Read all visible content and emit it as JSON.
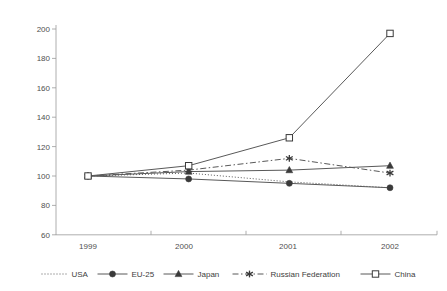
{
  "chart_data": {
    "type": "line",
    "title": "",
    "subtitle": "",
    "xlabel": "",
    "ylabel": "",
    "categories": [
      "1999",
      "2000",
      "2001",
      "2002"
    ],
    "x": [
      1999,
      2000,
      2001,
      2002
    ],
    "ylim": [
      60,
      200
    ],
    "yticks": [
      60,
      80,
      100,
      120,
      140,
      160,
      180,
      200
    ],
    "ytick_labels": [
      "60",
      "80",
      "100",
      "120",
      "140",
      "160",
      "180",
      "200"
    ],
    "xtick_labels": [
      "1999",
      "2000",
      "2001",
      "2002"
    ],
    "grid": false,
    "legend_position": "bottom",
    "series": [
      {
        "name": "USA",
        "values": [
          100,
          102,
          96,
          92
        ],
        "line_style": "dotted",
        "marker": "none",
        "color": "#595959"
      },
      {
        "name": "EU-25",
        "values": [
          100,
          98,
          95,
          92
        ],
        "line_style": "solid",
        "marker": "filled-circle",
        "color": "#595959"
      },
      {
        "name": "Japan",
        "values": [
          100,
          103,
          104,
          107
        ],
        "line_style": "solid",
        "marker": "filled-triangle",
        "color": "#595959"
      },
      {
        "name": "Russian Federation",
        "values": [
          100,
          104,
          112,
          102
        ],
        "line_style": "dash-dot",
        "marker": "asterisk",
        "color": "#595959"
      },
      {
        "name": "China",
        "values": [
          100,
          107,
          126,
          197
        ],
        "line_style": "solid",
        "marker": "open-square",
        "color": "#595959"
      }
    ]
  },
  "axis": {
    "y_tick_200": "200",
    "y_tick_180": "180",
    "y_tick_160": "160",
    "y_tick_140": "140",
    "y_tick_120": "120",
    "y_tick_100": "100",
    "y_tick_80": "80",
    "y_tick_60": "60",
    "x_tick_1999": "1999",
    "x_tick_2000": "2000",
    "x_tick_2001": "2001",
    "x_tick_2002": "2002"
  },
  "legend": {
    "items": [
      {
        "label": "USA"
      },
      {
        "label": "EU-25"
      },
      {
        "label": "Japan"
      },
      {
        "label": "Russian Federation"
      },
      {
        "label": "China"
      }
    ]
  },
  "colors": {
    "axis": "#9a9a9a",
    "line": "#595959",
    "marker": "#3a3a3a",
    "text": "#4f4f4f",
    "background": "#ffffff"
  }
}
